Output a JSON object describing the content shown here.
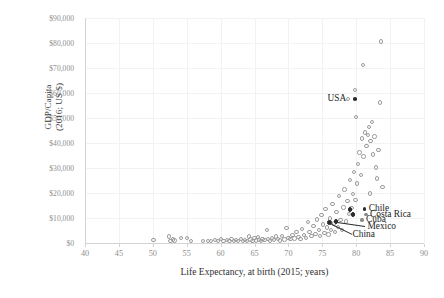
{
  "chart_data": {
    "type": "scatter",
    "title": "",
    "xlabel": "Life Expectancy, at birth (2015; years)",
    "ylabel": "GDP/Capita\n(2016; US $)",
    "ylabel_line1": "GDP/Capita",
    "ylabel_line2": "(2016; US $)",
    "xlim": [
      40,
      90
    ],
    "ylim": [
      0,
      90000
    ],
    "xticks": [
      40,
      45,
      50,
      55,
      60,
      65,
      70,
      75,
      80,
      85,
      90
    ],
    "xtick_labels": [
      "40",
      "45",
      "50",
      "55",
      "60",
      "65",
      "70",
      "75",
      "80",
      "85",
      "90"
    ],
    "yticks": [
      0,
      10000,
      20000,
      30000,
      40000,
      50000,
      60000,
      70000,
      80000,
      90000
    ],
    "ytick_labels": [
      "$0",
      "$10,000",
      "$20,000",
      "$30,000",
      "$40,000",
      "$50,000",
      "$60,000",
      "$70,000",
      "$80,000",
      "$90,000"
    ],
    "grid": true,
    "legend": "none",
    "marker": "open-circle",
    "marker_color": "#9b9b9b",
    "highlight_color": "#2b2b2b",
    "points": [
      [
        50.1,
        1100
      ],
      [
        52.4,
        2600
      ],
      [
        52.6,
        900
      ],
      [
        53.0,
        1400
      ],
      [
        53.2,
        1000
      ],
      [
        54.2,
        1900
      ],
      [
        55.0,
        2100
      ],
      [
        55.6,
        700
      ],
      [
        57.4,
        800
      ],
      [
        58.1,
        900
      ],
      [
        58.6,
        700
      ],
      [
        59.2,
        1200
      ],
      [
        59.6,
        800
      ],
      [
        60.1,
        1500
      ],
      [
        60.4,
        700
      ],
      [
        60.9,
        1100
      ],
      [
        61.3,
        900
      ],
      [
        61.6,
        1600
      ],
      [
        62.0,
        800
      ],
      [
        62.3,
        1300
      ],
      [
        62.6,
        700
      ],
      [
        63.0,
        1500
      ],
      [
        63.3,
        900
      ],
      [
        63.6,
        1200
      ],
      [
        63.9,
        700
      ],
      [
        64.2,
        2600
      ],
      [
        64.4,
        1400
      ],
      [
        64.7,
        800
      ],
      [
        65.0,
        1900
      ],
      [
        65.2,
        1000
      ],
      [
        65.5,
        2300
      ],
      [
        65.7,
        1300
      ],
      [
        66.0,
        800
      ],
      [
        66.2,
        1700
      ],
      [
        66.5,
        1100
      ],
      [
        66.8,
        5200
      ],
      [
        67.0,
        1500
      ],
      [
        67.3,
        900
      ],
      [
        67.6,
        2000
      ],
      [
        67.9,
        1300
      ],
      [
        68.2,
        2600
      ],
      [
        68.5,
        1700
      ],
      [
        68.8,
        1000
      ],
      [
        69.1,
        2900
      ],
      [
        69.4,
        1400
      ],
      [
        69.7,
        6100
      ],
      [
        70.0,
        2100
      ],
      [
        70.3,
        1500
      ],
      [
        70.6,
        3200
      ],
      [
        70.9,
        1800
      ],
      [
        71.2,
        4300
      ],
      [
        71.5,
        2400
      ],
      [
        71.8,
        1600
      ],
      [
        72.0,
        5600
      ],
      [
        72.3,
        3100
      ],
      [
        72.6,
        2000
      ],
      [
        72.9,
        8300
      ],
      [
        73.1,
        4500
      ],
      [
        73.4,
        2700
      ],
      [
        73.7,
        6800
      ],
      [
        74.0,
        3600
      ],
      [
        74.2,
        9400
      ],
      [
        74.5,
        5200
      ],
      [
        74.7,
        2900
      ],
      [
        74.9,
        11200
      ],
      [
        75.1,
        7400
      ],
      [
        75.3,
        4100
      ],
      [
        75.5,
        13500
      ],
      [
        75.7,
        6200
      ],
      [
        75.9,
        3400
      ],
      [
        76.1,
        9800
      ],
      [
        76.3,
        5100
      ],
      [
        76.5,
        15600
      ],
      [
        76.7,
        7800
      ],
      [
        76.9,
        4400
      ],
      [
        77.1,
        12300
      ],
      [
        77.3,
        6400
      ],
      [
        77.5,
        18700
      ],
      [
        77.7,
        9100
      ],
      [
        77.9,
        5300
      ],
      [
        78.1,
        14200
      ],
      [
        78.3,
        21400
      ],
      [
        78.5,
        8600
      ],
      [
        78.7,
        16800
      ],
      [
        78.9,
        11500
      ],
      [
        79.1,
        25300
      ],
      [
        79.3,
        13900
      ],
      [
        79.5,
        19600
      ],
      [
        79.7,
        28400
      ],
      [
        79.9,
        17200
      ],
      [
        80.1,
        23800
      ],
      [
        80.3,
        31500
      ],
      [
        80.5,
        36200
      ],
      [
        80.7,
        27100
      ],
      [
        80.9,
        41800
      ],
      [
        81.1,
        34600
      ],
      [
        81.3,
        44200
      ],
      [
        81.5,
        38900
      ],
      [
        81.7,
        43100
      ],
      [
        81.9,
        46500
      ],
      [
        82.1,
        40700
      ],
      [
        82.3,
        48300
      ],
      [
        82.5,
        35400
      ],
      [
        82.7,
        42600
      ],
      [
        82.9,
        30200
      ],
      [
        83.1,
        25800
      ],
      [
        83.3,
        37100
      ],
      [
        83.5,
        56200
      ],
      [
        83.7,
        80600
      ],
      [
        81.0,
        71200
      ],
      [
        79.8,
        61300
      ],
      [
        78.8,
        57600
      ],
      [
        83.9,
        22400
      ],
      [
        82.0,
        19800
      ],
      [
        80.0,
        50400
      ]
    ],
    "annotations": [
      {
        "label": "USA",
        "x": 79.3,
        "y": 57600,
        "dot": "filled-small",
        "dot_side": "right"
      },
      {
        "label": "Chile",
        "x": 82.0,
        "y": 13500,
        "dot": "filled-small",
        "dot_side": "left"
      },
      {
        "label": "Costa Rica",
        "x": 82.2,
        "y": 11400,
        "dot": "grey-small",
        "dot_side": "left"
      },
      {
        "label": "Cuba",
        "x": 81.6,
        "y": 9200,
        "dot": "grey-small",
        "dot_side": "left"
      },
      {
        "label": "Mexico",
        "x": 81.8,
        "y": 6600,
        "dot": "none",
        "dot_side": "none"
      },
      {
        "label": "China",
        "x": 79.6,
        "y": 3400,
        "dot": "none",
        "dot_side": "none"
      }
    ],
    "highlighted_points": [
      {
        "name": "Chile",
        "x": 79.1,
        "y": 13400
      },
      {
        "name": "Costa Rica",
        "x": 79.5,
        "y": 11300
      },
      {
        "name": "Mexico",
        "x": 77.0,
        "y": 8600
      },
      {
        "name": "China",
        "x": 76.1,
        "y": 8100
      }
    ]
  }
}
